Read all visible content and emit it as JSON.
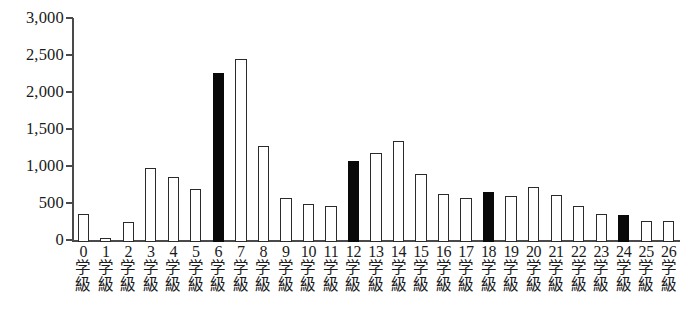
{
  "chart_data": {
    "type": "bar",
    "title": "",
    "subtitle": "",
    "xlabel": "",
    "ylabel": "",
    "categories": [
      "0学級",
      "1学級",
      "2学級",
      "3学級",
      "4学級",
      "5学級",
      "6学級",
      "7学級",
      "8学級",
      "9学級",
      "10学級",
      "11学級",
      "12学級",
      "13学級",
      "14学級",
      "15学級",
      "16学級",
      "17学級",
      "18学級",
      "19学級",
      "20学級",
      "21学級",
      "22学級",
      "23学級",
      "24学級",
      "25学級",
      "26学級"
    ],
    "category_numbers": [
      "0",
      "1",
      "2",
      "3",
      "4",
      "5",
      "6",
      "7",
      "8",
      "9",
      "10",
      "11",
      "12",
      "13",
      "14",
      "15",
      "16",
      "17",
      "18",
      "19",
      "20",
      "21",
      "22",
      "23",
      "24",
      "25",
      "26"
    ],
    "category_unit_chars": [
      "学",
      "級"
    ],
    "values": [
      380,
      60,
      270,
      1000,
      880,
      710,
      2290,
      2470,
      1300,
      600,
      520,
      490,
      1090,
      1200,
      1360,
      920,
      650,
      600,
      680,
      620,
      740,
      640,
      490,
      380,
      360,
      290,
      290
    ],
    "highlighted_indices": [
      6,
      12,
      18,
      24
    ],
    "ylim": [
      0,
      3000
    ],
    "ytick_values": [
      0,
      500,
      1000,
      1500,
      2000,
      2500,
      3000
    ],
    "ytick_labels": [
      "0",
      "500",
      "1,000",
      "1,500",
      "2,000",
      "2,500",
      "3,000"
    ],
    "grid": false,
    "legend": null,
    "colors": {
      "bar_fill": "#ffffff",
      "bar_outline": "#2b2b2b",
      "bar_highlight": "#090909",
      "axis": "#4a4a4a",
      "text": "#1a1a1a",
      "background": "#ffffff"
    }
  }
}
